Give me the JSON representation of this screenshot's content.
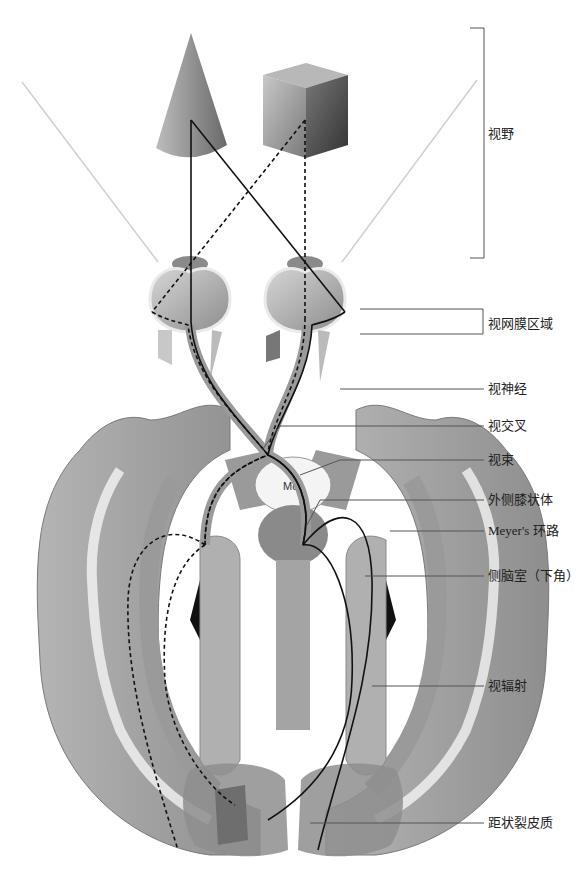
{
  "colors": {
    "background": "#ffffff",
    "cortex": "#a8a8a8",
    "cortex_dark": "#6e6e6e",
    "tract_line": "#111111",
    "leader_line": "#555555",
    "visual_field_ray": "#cfcfcf",
    "ventricle": "#111111"
  },
  "objects": {
    "left": "cone",
    "right": "cube"
  },
  "brainstem_label": "Md",
  "labels": [
    {
      "id": "visual-field",
      "text": "视野",
      "x": 488,
      "y": 126
    },
    {
      "id": "retinal-region",
      "text": "视网膜区域",
      "x": 488,
      "y": 316
    },
    {
      "id": "optic-nerve",
      "text": "视神经",
      "x": 488,
      "y": 383
    },
    {
      "id": "optic-chiasm",
      "text": "视交叉",
      "x": 488,
      "y": 418
    },
    {
      "id": "optic-tract",
      "text": "视束",
      "x": 488,
      "y": 452
    },
    {
      "id": "lateral-geniculate-body",
      "text": "外侧膝状体",
      "x": 488,
      "y": 492
    },
    {
      "id": "meyers-loop",
      "text": "Meyer's 环路",
      "x": 488,
      "y": 524
    },
    {
      "id": "lateral-ventricle-inferior-horn",
      "text": "侧脑室（下角）",
      "x": 488,
      "y": 569
    },
    {
      "id": "optic-radiation",
      "text": "视辐射",
      "x": 488,
      "y": 680
    },
    {
      "id": "calcarine-cortex",
      "text": "距状裂皮质",
      "x": 488,
      "y": 815
    }
  ]
}
